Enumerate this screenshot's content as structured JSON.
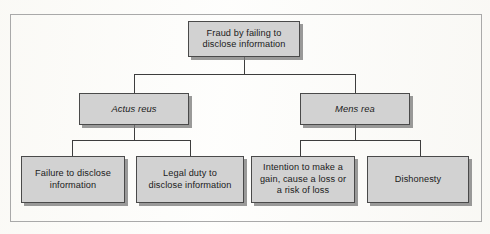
{
  "figure": {
    "type": "hierarchy-flowchart",
    "title": "Fraud by failing to disclose information",
    "levels": 3,
    "frame_color": "#a9a9a9",
    "node_fill": "#d2d2d2",
    "node_border": "#4a4a4a",
    "connector_color": "#3d3d3d",
    "background": "#fdfdfb"
  },
  "nodes": {
    "root": {
      "id": "fraud-by-failing-to-disclose-information",
      "label": "Fraud by failing to\ndisclose information",
      "level": 1,
      "italic": false
    },
    "actus_reus": {
      "id": "actus-reus",
      "label": "Actus reus",
      "level": 2,
      "italic": true
    },
    "mens_rea": {
      "id": "mens-rea",
      "label": "Mens rea",
      "level": 2,
      "italic": true
    },
    "failure_to_disclose": {
      "id": "failure-to-disclose-information",
      "label": "Failure to disclose\ninformation",
      "level": 3,
      "italic": false,
      "parent": "actus-reus"
    },
    "legal_duty": {
      "id": "legal-duty-to-disclose-information",
      "label": "Legal duty to\ndisclose information",
      "level": 3,
      "italic": false,
      "parent": "actus-reus"
    },
    "intention": {
      "id": "intention-to-make-a-gain",
      "label": "Intention to make a\ngain, cause a loss or\na risk of loss",
      "level": 3,
      "italic": false,
      "parent": "mens-rea"
    },
    "dishonesty": {
      "id": "dishonesty",
      "label": "Dishonesty",
      "level": 3,
      "italic": false,
      "parent": "mens-rea"
    }
  },
  "edges": [
    {
      "from": "fraud-by-failing-to-disclose-information",
      "to": "actus-reus"
    },
    {
      "from": "fraud-by-failing-to-disclose-information",
      "to": "mens-rea"
    },
    {
      "from": "actus-reus",
      "to": "failure-to-disclose-information"
    },
    {
      "from": "actus-reus",
      "to": "legal-duty-to-disclose-information"
    },
    {
      "from": "mens-rea",
      "to": "intention-to-make-a-gain"
    },
    {
      "from": "mens-rea",
      "to": "dishonesty"
    }
  ]
}
